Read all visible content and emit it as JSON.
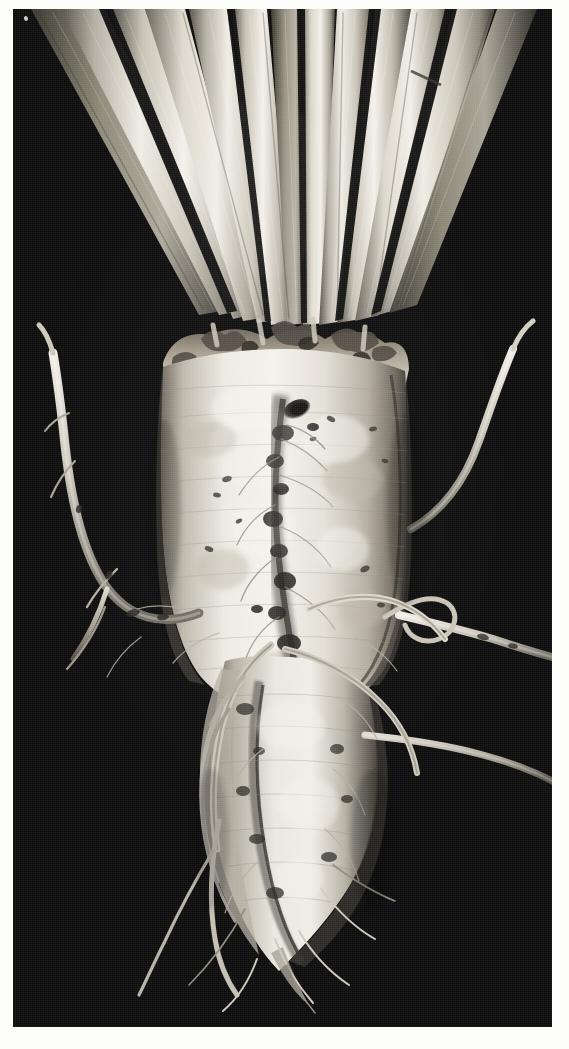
{
  "figure": {
    "kind": "photograph",
    "medium": "black-and-white halftone scan",
    "orientation": "portrait",
    "caption": "",
    "title": ""
  },
  "plate": {
    "page_background": "#fdfdfc",
    "photo_background": "#0c0c0c",
    "photo_left": 13,
    "photo_top": 9,
    "photo_width": 539,
    "photo_height": 1018
  },
  "palette": {
    "background_black": "#0c0c0c",
    "background_mottle": "#151515",
    "root_highlight": "#f2efe8",
    "root_midtone": "#cfcabd",
    "root_shadow": "#6e675c",
    "petiole_highlight": "#efece4",
    "petiole_midtone": "#b9b4a8",
    "petiole_shadow": "#4a463e",
    "lesion_dark": "#171512",
    "crown_debris": "#5d564b",
    "page_white": "#fdfdfc"
  },
  "scene": {
    "elements": [
      {
        "name": "leaf-petiole-fan",
        "count": 12,
        "region": "top",
        "description": "Pale ribbed leaf stalks radiating upward and outward from the crown"
      },
      {
        "name": "crown",
        "region": "upper-center",
        "description": "Rough scarred shoulder where petioles meet the root body"
      },
      {
        "name": "root-body-upper",
        "region": "center",
        "description": "Swollen pale cylindrical storage root"
      },
      {
        "name": "root-body-lower",
        "region": "lower-center",
        "description": "Tapering forked lower portion of the taproot"
      },
      {
        "name": "lateral-root-left",
        "region": "left",
        "description": "Long lateral root curving up and to the left"
      },
      {
        "name": "lateral-root-right-upper",
        "region": "right",
        "description": "Lateral root sweeping up and right"
      },
      {
        "name": "lateral-root-right-lower",
        "region": "right",
        "description": "Horizontal lateral root reaching the right margin"
      },
      {
        "name": "fibrous-root-groove",
        "region": "center",
        "description": "Vertical root groove carrying fine fibrous roots"
      },
      {
        "name": "dark-lesion",
        "region": "upper-center",
        "description": "Dark cavity or lesion on the root shoulder"
      },
      {
        "name": "background-seam",
        "region": "lower",
        "description": "Faint horizontal line across the dark backdrop"
      }
    ],
    "lateral_root_count": 14,
    "fibrous_root_count": 30,
    "petiole_count": 12
  }
}
